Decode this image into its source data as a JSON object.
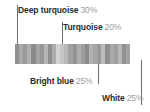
{
  "diagram": {
    "title_visible": false,
    "background_color": "#ffffff",
    "line_color": "#6e6e6e",
    "name_text_color": "#2b2b2b",
    "percent_text_color": "#9a9a9a"
  },
  "callouts": [
    {
      "id": "deep-turquoise",
      "name": "Deep turquoise",
      "percent": "30%"
    },
    {
      "id": "turquoise",
      "name": "Turquoise",
      "percent": "20%"
    },
    {
      "id": "bright-blue",
      "name": "Bright blue",
      "percent": "25%"
    },
    {
      "id": "white",
      "name": "White",
      "percent": "25%"
    }
  ],
  "chart_data": {
    "type": "bar",
    "title": "",
    "xlabel": "",
    "ylabel": "",
    "categories": [
      "Deep turquoise",
      "Turquoise",
      "Bright blue",
      "White"
    ],
    "values": [
      30,
      20,
      25,
      25
    ],
    "value_unit": "%",
    "legend_position": "callout-labels",
    "grid": false,
    "note": "Grayscale-rendered color proportion strip; percentages sum to 100%"
  },
  "swatch_bar": {
    "label": "color-proportion-strip",
    "base_color": "#b4b4b4",
    "stripe_colors": [
      "#8f8f8f",
      "#a8a8a8",
      "#9b9b9b",
      "#b0b0b0",
      "#8b8b8b",
      "#a4a4a4",
      "#979797",
      "#b6b6b6",
      "#8e8e8e",
      "#ababab",
      "#d2d2d2",
      "#c5c5c5",
      "#b9b9b9",
      "#a1a1a1",
      "#949494",
      "#aeaeae",
      "#9d9d9d",
      "#8a8a8a",
      "#b3b3b3",
      "#a6a6a6",
      "#999999",
      "#bcbcbc",
      "#8d8d8d",
      "#a9a9a9",
      "#9f9f9f",
      "#b7b7b7",
      "#929292",
      "#a2a2a2"
    ]
  }
}
